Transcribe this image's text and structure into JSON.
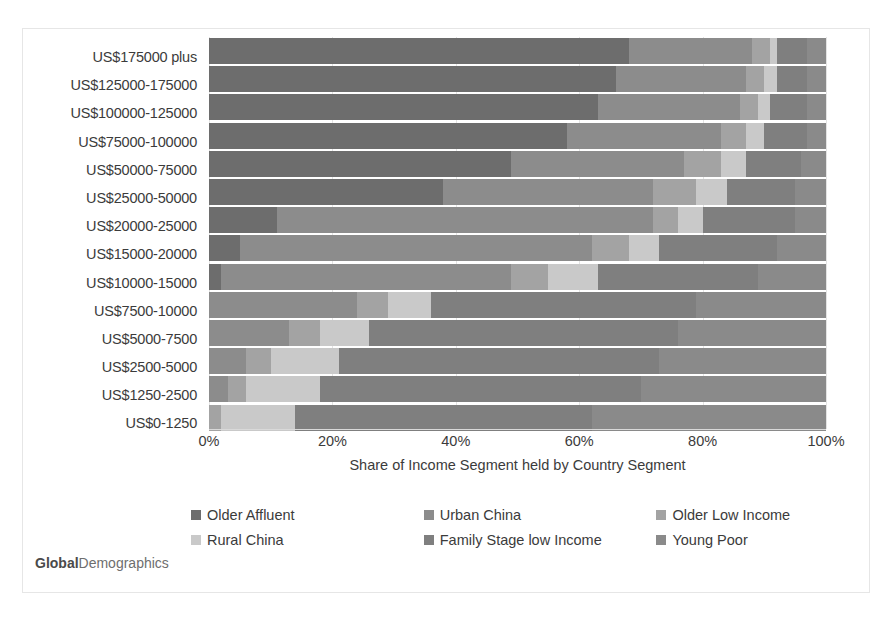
{
  "watermark": {
    "bold_part": "Global",
    "rest": "Demographics"
  },
  "axis": {
    "x_title": "Share of Income Segment held by Country Segment",
    "x_ticks": [
      "0%",
      "20%",
      "40%",
      "60%",
      "80%",
      "100%"
    ]
  },
  "legend": {
    "items": [
      {
        "label": "Older Affluent",
        "color": "#6d6d6d"
      },
      {
        "label": "Urban China",
        "color": "#8c8c8c"
      },
      {
        "label": "Older Low Income",
        "color": "#a3a3a3"
      },
      {
        "label": "Rural China",
        "color": "#c9c9c9"
      },
      {
        "label": "Family Stage low Income",
        "color": "#7f7f7f"
      },
      {
        "label": "Young Poor",
        "color": "#8a8a8a"
      }
    ]
  },
  "chart_data": {
    "type": "bar",
    "orientation": "horizontal",
    "stacked": true,
    "normalized_percent": true,
    "title": "",
    "xlabel": "Share of Income Segment held by Country Segment",
    "ylabel": "",
    "xlim": [
      0,
      100
    ],
    "xticks": [
      0,
      20,
      40,
      60,
      80,
      100
    ],
    "grid": true,
    "legend_position": "bottom",
    "categories": [
      "US$175000 plus",
      "US$125000-175000",
      "US$100000-125000",
      "US$75000-100000",
      "US$50000-75000",
      "US$25000-50000",
      "US$20000-25000",
      "US$15000-20000",
      "US$10000-15000",
      "US$7500-10000",
      "US$5000-7500",
      "US$2500-5000",
      "US$1250-2500",
      "US$0-1250"
    ],
    "series": [
      {
        "name": "Older Affluent",
        "color": "#6d6d6d",
        "values": [
          68,
          66,
          63,
          58,
          49,
          38,
          11,
          5,
          2,
          0,
          0,
          0,
          0,
          0
        ]
      },
      {
        "name": "Urban China",
        "color": "#8c8c8c",
        "values": [
          20,
          21,
          23,
          25,
          28,
          34,
          61,
          57,
          47,
          24,
          13,
          6,
          3,
          0
        ]
      },
      {
        "name": "Older Low Income",
        "color": "#a3a3a3",
        "values": [
          3,
          3,
          3,
          4,
          6,
          7,
          4,
          6,
          6,
          5,
          5,
          4,
          3,
          2
        ]
      },
      {
        "name": "Rural China",
        "color": "#c9c9c9",
        "values": [
          1,
          2,
          2,
          3,
          4,
          5,
          4,
          5,
          8,
          7,
          8,
          11,
          12,
          12
        ]
      },
      {
        "name": "Family Stage low Income",
        "color": "#7f7f7f",
        "values": [
          5,
          5,
          6,
          7,
          9,
          11,
          15,
          19,
          26,
          43,
          50,
          52,
          52,
          48
        ]
      },
      {
        "name": "Young Poor",
        "color": "#8a8a8a",
        "values": [
          3,
          3,
          3,
          3,
          4,
          5,
          5,
          8,
          11,
          21,
          24,
          27,
          30,
          38
        ]
      }
    ]
  }
}
